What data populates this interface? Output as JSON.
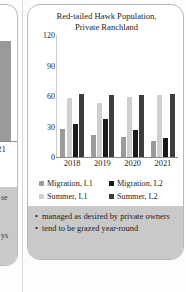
{
  "left_panel": {
    "year_label": "21",
    "fragment_top": "se",
    "fragment_bottom": "ys"
  },
  "card": {
    "title_line1": "Red-tailed Hawk Population,",
    "title_line2": "Private Ranchland"
  },
  "legend": [
    {
      "label": "Migration, L1",
      "color": "#9b9b9b"
    },
    {
      "label": "Migration, L2",
      "color": "#1a1a1a"
    },
    {
      "label": "Summer, L1",
      "color": "#cfcfcf"
    },
    {
      "label": "Summer, L2",
      "color": "#3d3d3d"
    }
  ],
  "bullets": [
    {
      "marker": "•",
      "text": "managed as desired by private owners"
    },
    {
      "marker": "•",
      "text": "tend to be grazed year-round"
    }
  ],
  "chart_data": {
    "type": "bar",
    "title": "Red-tailed Hawk Population, Private Ranchland",
    "xlabel": "",
    "ylabel": "",
    "ylim": [
      0,
      120
    ],
    "yticks": [
      120,
      90,
      60,
      30,
      0
    ],
    "grid": false,
    "legend_position": "bottom",
    "categories": [
      "2018",
      "2019",
      "2020",
      "2021"
    ],
    "series": [
      {
        "name": "Migration, L1",
        "color": "#9b9b9b",
        "values": [
          28,
          22,
          20,
          16
        ]
      },
      {
        "name": "Summer, L1",
        "color": "#cfcfcf",
        "values": [
          58,
          53,
          59,
          61
        ]
      },
      {
        "name": "Migration, L2",
        "color": "#1a1a1a",
        "values": [
          32,
          37,
          27,
          19
        ]
      },
      {
        "name": "Summer, L2",
        "color": "#3d3d3d",
        "values": [
          62,
          61,
          61,
          62
        ]
      }
    ]
  }
}
